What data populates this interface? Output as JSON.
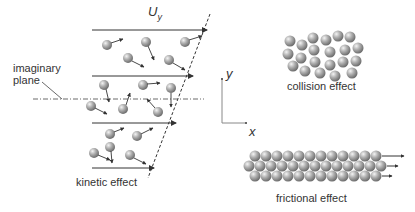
{
  "labels": {
    "velocity": "U",
    "velocity_sub": "y",
    "plane_line1": "imaginary",
    "plane_line2": "plane",
    "kinetic": "kinetic effect",
    "collision": "collision effect",
    "frictional": "frictional effect",
    "axis_x": "x",
    "axis_y": "y"
  },
  "colors": {
    "line": "#333333",
    "ball_light": "#eeeeee",
    "ball_mid": "#a8a8a8",
    "ball_dark": "#6e6e6e"
  }
}
